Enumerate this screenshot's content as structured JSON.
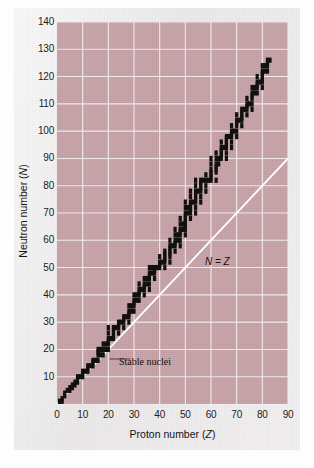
{
  "figure": {
    "x_axis_title": "Proton number (",
    "x_axis_title_italic": "Z",
    "x_axis_title_tail": ")",
    "y_axis_title": "Neutron number (",
    "y_axis_title_italic": "N",
    "y_axis_title_tail": ")",
    "annotation_nz": "N = Z",
    "annotation_stable": "Stable nuclei"
  },
  "chart_data": {
    "type": "scatter",
    "title": "",
    "subtitle": "",
    "xlabel": "Proton number (Z)",
    "ylabel": "Neutron number (N)",
    "xlim": [
      0,
      90
    ],
    "ylim": [
      0,
      140
    ],
    "xticks": [
      0,
      10,
      20,
      30,
      40,
      50,
      60,
      70,
      80,
      90
    ],
    "yticks": [
      10,
      20,
      30,
      40,
      50,
      60,
      70,
      80,
      90,
      100,
      110,
      120,
      130,
      140
    ],
    "grid": true,
    "grid_color": "#f2eceb",
    "plot_background": "#c3a1a7",
    "legend_position": "none",
    "annotations": [
      {
        "text": "N = Z",
        "x": 58,
        "y": 58,
        "note": "label on the diagonal reference line"
      },
      {
        "text": "Stable nuclei",
        "x": 30,
        "y": 16,
        "note": "leader line points to the band of stable nuclides near Z=18"
      }
    ],
    "series": [
      {
        "name": "N = Z",
        "type": "line",
        "color": "#ffffff",
        "x": [
          0,
          90
        ],
        "values": [
          0,
          90
        ]
      },
      {
        "name": "Stable nuclei",
        "type": "scatter",
        "color": "#111111",
        "marker": "square",
        "note": "Band of stable nuclides: (Z, N) pairs of the stable isotopes",
        "points": [
          [
            1,
            0
          ],
          [
            1,
            1
          ],
          [
            2,
            1
          ],
          [
            2,
            2
          ],
          [
            3,
            3
          ],
          [
            3,
            4
          ],
          [
            4,
            5
          ],
          [
            5,
            5
          ],
          [
            5,
            6
          ],
          [
            6,
            6
          ],
          [
            6,
            7
          ],
          [
            7,
            7
          ],
          [
            7,
            8
          ],
          [
            8,
            8
          ],
          [
            8,
            9
          ],
          [
            8,
            10
          ],
          [
            9,
            10
          ],
          [
            10,
            10
          ],
          [
            10,
            11
          ],
          [
            10,
            12
          ],
          [
            11,
            12
          ],
          [
            12,
            12
          ],
          [
            12,
            13
          ],
          [
            12,
            14
          ],
          [
            13,
            14
          ],
          [
            14,
            14
          ],
          [
            14,
            15
          ],
          [
            14,
            16
          ],
          [
            15,
            16
          ],
          [
            16,
            16
          ],
          [
            16,
            18
          ],
          [
            16,
            19
          ],
          [
            16,
            20
          ],
          [
            17,
            18
          ],
          [
            17,
            20
          ],
          [
            18,
            18
          ],
          [
            18,
            20
          ],
          [
            18,
            22
          ],
          [
            19,
            20
          ],
          [
            19,
            22
          ],
          [
            20,
            20
          ],
          [
            20,
            22
          ],
          [
            20,
            23
          ],
          [
            20,
            24
          ],
          [
            20,
            26
          ],
          [
            20,
            28
          ],
          [
            21,
            24
          ],
          [
            22,
            24
          ],
          [
            22,
            25
          ],
          [
            22,
            26
          ],
          [
            22,
            27
          ],
          [
            22,
            28
          ],
          [
            23,
            28
          ],
          [
            24,
            26
          ],
          [
            24,
            28
          ],
          [
            24,
            29
          ],
          [
            24,
            30
          ],
          [
            25,
            30
          ],
          [
            26,
            28
          ],
          [
            26,
            30
          ],
          [
            26,
            31
          ],
          [
            26,
            32
          ],
          [
            27,
            32
          ],
          [
            28,
            30
          ],
          [
            28,
            32
          ],
          [
            28,
            33
          ],
          [
            28,
            34
          ],
          [
            28,
            36
          ],
          [
            29,
            34
          ],
          [
            29,
            36
          ],
          [
            30,
            34
          ],
          [
            30,
            36
          ],
          [
            30,
            37
          ],
          [
            30,
            38
          ],
          [
            30,
            40
          ],
          [
            31,
            38
          ],
          [
            31,
            40
          ],
          [
            32,
            38
          ],
          [
            32,
            40
          ],
          [
            32,
            41
          ],
          [
            32,
            42
          ],
          [
            32,
            44
          ],
          [
            33,
            42
          ],
          [
            34,
            40
          ],
          [
            34,
            42
          ],
          [
            34,
            43
          ],
          [
            34,
            44
          ],
          [
            34,
            46
          ],
          [
            35,
            44
          ],
          [
            35,
            46
          ],
          [
            36,
            42
          ],
          [
            36,
            44
          ],
          [
            36,
            46
          ],
          [
            36,
            47
          ],
          [
            36,
            48
          ],
          [
            36,
            50
          ],
          [
            37,
            48
          ],
          [
            37,
            50
          ],
          [
            38,
            46
          ],
          [
            38,
            48
          ],
          [
            38,
            49
          ],
          [
            38,
            50
          ],
          [
            39,
            50
          ],
          [
            40,
            50
          ],
          [
            40,
            51
          ],
          [
            40,
            52
          ],
          [
            40,
            54
          ],
          [
            41,
            52
          ],
          [
            42,
            50
          ],
          [
            42,
            52
          ],
          [
            42,
            53
          ],
          [
            42,
            54
          ],
          [
            42,
            55
          ],
          [
            42,
            56
          ],
          [
            44,
            52
          ],
          [
            44,
            54
          ],
          [
            44,
            55
          ],
          [
            44,
            56
          ],
          [
            44,
            57
          ],
          [
            44,
            58
          ],
          [
            44,
            60
          ],
          [
            45,
            58
          ],
          [
            46,
            56
          ],
          [
            46,
            58
          ],
          [
            46,
            59
          ],
          [
            46,
            60
          ],
          [
            46,
            62
          ],
          [
            46,
            64
          ],
          [
            47,
            60
          ],
          [
            47,
            62
          ],
          [
            48,
            58
          ],
          [
            48,
            60
          ],
          [
            48,
            62
          ],
          [
            48,
            63
          ],
          [
            48,
            64
          ],
          [
            48,
            66
          ],
          [
            48,
            68
          ],
          [
            49,
            64
          ],
          [
            49,
            66
          ],
          [
            50,
            62
          ],
          [
            50,
            64
          ],
          [
            50,
            65
          ],
          [
            50,
            66
          ],
          [
            50,
            67
          ],
          [
            50,
            68
          ],
          [
            50,
            69
          ],
          [
            50,
            70
          ],
          [
            50,
            72
          ],
          [
            50,
            74
          ],
          [
            51,
            70
          ],
          [
            51,
            72
          ],
          [
            52,
            68
          ],
          [
            52,
            70
          ],
          [
            52,
            71
          ],
          [
            52,
            72
          ],
          [
            52,
            73
          ],
          [
            52,
            74
          ],
          [
            52,
            76
          ],
          [
            52,
            78
          ],
          [
            53,
            74
          ],
          [
            54,
            70
          ],
          [
            54,
            72
          ],
          [
            54,
            74
          ],
          [
            54,
            75
          ],
          [
            54,
            76
          ],
          [
            54,
            77
          ],
          [
            54,
            78
          ],
          [
            54,
            80
          ],
          [
            54,
            82
          ],
          [
            55,
            78
          ],
          [
            56,
            74
          ],
          [
            56,
            76
          ],
          [
            56,
            78
          ],
          [
            56,
            79
          ],
          [
            56,
            80
          ],
          [
            56,
            81
          ],
          [
            56,
            82
          ],
          [
            57,
            82
          ],
          [
            58,
            78
          ],
          [
            58,
            80
          ],
          [
            58,
            82
          ],
          [
            58,
            84
          ],
          [
            59,
            82
          ],
          [
            60,
            82
          ],
          [
            60,
            83
          ],
          [
            60,
            84
          ],
          [
            60,
            85
          ],
          [
            60,
            86
          ],
          [
            60,
            88
          ],
          [
            60,
            90
          ],
          [
            62,
            82
          ],
          [
            62,
            85
          ],
          [
            62,
            86
          ],
          [
            62,
            87
          ],
          [
            62,
            88
          ],
          [
            62,
            90
          ],
          [
            62,
            92
          ],
          [
            63,
            88
          ],
          [
            63,
            90
          ],
          [
            64,
            90
          ],
          [
            64,
            91
          ],
          [
            64,
            92
          ],
          [
            64,
            93
          ],
          [
            64,
            94
          ],
          [
            64,
            96
          ],
          [
            65,
            94
          ],
          [
            66,
            90
          ],
          [
            66,
            92
          ],
          [
            66,
            94
          ],
          [
            66,
            95
          ],
          [
            66,
            96
          ],
          [
            66,
            97
          ],
          [
            66,
            98
          ],
          [
            67,
            98
          ],
          [
            68,
            94
          ],
          [
            68,
            96
          ],
          [
            68,
            98
          ],
          [
            68,
            99
          ],
          [
            68,
            100
          ],
          [
            68,
            102
          ],
          [
            69,
            100
          ],
          [
            70,
            98
          ],
          [
            70,
            100
          ],
          [
            70,
            102
          ],
          [
            70,
            103
          ],
          [
            70,
            104
          ],
          [
            70,
            106
          ],
          [
            71,
            104
          ],
          [
            72,
            102
          ],
          [
            72,
            104
          ],
          [
            72,
            105
          ],
          [
            72,
            106
          ],
          [
            72,
            107
          ],
          [
            72,
            108
          ],
          [
            73,
            108
          ],
          [
            74,
            106
          ],
          [
            74,
            108
          ],
          [
            74,
            109
          ],
          [
            74,
            110
          ],
          [
            74,
            112
          ],
          [
            75,
            110
          ],
          [
            76,
            108
          ],
          [
            76,
            110
          ],
          [
            76,
            112
          ],
          [
            76,
            113
          ],
          [
            76,
            114
          ],
          [
            76,
            116
          ],
          [
            77,
            114
          ],
          [
            77,
            116
          ],
          [
            78,
            114
          ],
          [
            78,
            116
          ],
          [
            78,
            117
          ],
          [
            78,
            118
          ],
          [
            78,
            120
          ],
          [
            79,
            118
          ],
          [
            80,
            116
          ],
          [
            80,
            118
          ],
          [
            80,
            119
          ],
          [
            80,
            120
          ],
          [
            80,
            121
          ],
          [
            80,
            122
          ],
          [
            80,
            124
          ],
          [
            81,
            122
          ],
          [
            81,
            124
          ],
          [
            82,
            122
          ],
          [
            82,
            124
          ],
          [
            82,
            125
          ],
          [
            82,
            126
          ],
          [
            83,
            126
          ]
        ]
      }
    ]
  }
}
